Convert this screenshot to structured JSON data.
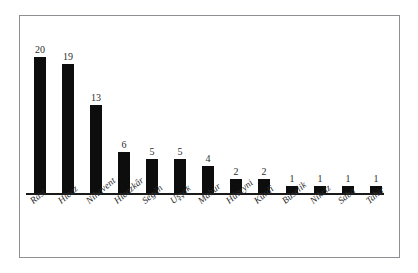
{
  "figure": {
    "background_color": "#ffffff",
    "frame_color": "#8f8f93",
    "bar_color": "#0d0d0d",
    "axis_color": "#1a1a1a",
    "label_color": "#2b2b2b"
  },
  "chart_data": {
    "type": "bar",
    "title": "",
    "subtitle": "",
    "xlabel": "",
    "ylabel": "",
    "categories": [
      "Rast",
      "Hicaz",
      "Nihavent",
      "Hicazkâr",
      "Segâh",
      "Uşşak",
      "Mahur",
      "Hüseyni",
      "Kürdî",
      "Büselik",
      "Nikriz",
      "Saba",
      "Tahir"
    ],
    "values": [
      20,
      19,
      13,
      6,
      5,
      5,
      4,
      2,
      2,
      1,
      1,
      1,
      1
    ],
    "value_labels": [
      "20",
      "19",
      "13",
      "6",
      "5",
      "5",
      "4",
      "2",
      "2",
      "1",
      "1",
      "1",
      "1"
    ],
    "ylim": [
      0,
      20
    ],
    "grid": false,
    "legend": false,
    "legend_position": "none",
    "axis_ticks_visible": false,
    "data_labels_shown": true,
    "tick_label_rotation": -40
  }
}
